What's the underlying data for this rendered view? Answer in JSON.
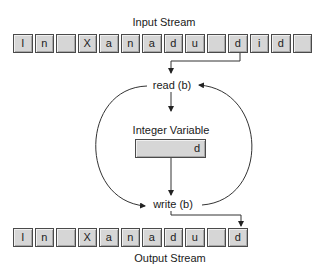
{
  "input_stream": {
    "label": "Input Stream",
    "cells": [
      "I",
      "n",
      "",
      "X",
      "a",
      "n",
      "a",
      "d",
      "u",
      "",
      "d",
      "i",
      "d",
      ""
    ]
  },
  "process": {
    "read_label": "read (b)",
    "write_label": "write (b)"
  },
  "variable": {
    "label": "Integer Variable",
    "value": "d"
  },
  "output_stream": {
    "label": "Output Stream",
    "cells": [
      "I",
      "n",
      "",
      "X",
      "a",
      "n",
      "a",
      "d",
      "u",
      "",
      "d"
    ]
  },
  "colors": {
    "cell_fill": "#d6d6d6",
    "cell_border": "#4a4a4a",
    "line": "#333333"
  }
}
